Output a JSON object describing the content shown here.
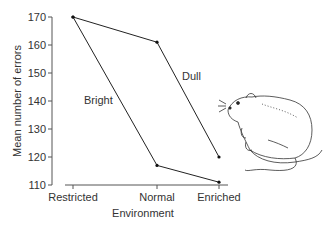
{
  "chart_data": {
    "type": "line",
    "title": "",
    "xlabel": "Environment",
    "ylabel": "Mean number of errors",
    "categories": [
      "Restricted",
      "Normal",
      "Enriched"
    ],
    "ylim": [
      110,
      170
    ],
    "yticks": [
      110,
      120,
      130,
      140,
      150,
      160,
      170
    ],
    "grid": false,
    "legend": "inline labels",
    "series": [
      {
        "name": "Dull",
        "values": [
          170,
          161,
          120
        ]
      },
      {
        "name": "Bright",
        "values": [
          170,
          117,
          111
        ]
      }
    ],
    "annotations": [
      "Illustration of a rat at right"
    ]
  }
}
